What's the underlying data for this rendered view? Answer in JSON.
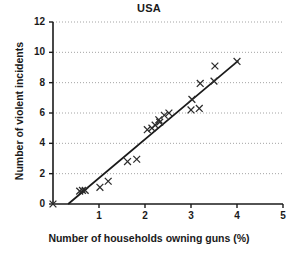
{
  "chart_data": {
    "type": "scatter",
    "title": "USA",
    "xlabel": "Number of households owning guns (%)",
    "ylabel": "Number of violent incidents",
    "xlim": [
      0,
      5
    ],
    "ylim": [
      0,
      12
    ],
    "xticks": [
      "0",
      "1",
      "2",
      "3",
      "4",
      "5"
    ],
    "yticks": [
      "0",
      "2",
      "4",
      "6",
      "8",
      "10",
      "12"
    ],
    "grid": "horizontal-dotted",
    "legend": "none",
    "marker": "x",
    "marker_color": "#2b2b2b",
    "line_color": "#1a1a1a",
    "points": [
      {
        "x": 0.0,
        "y": 0.0
      },
      {
        "x": 0.58,
        "y": 0.85
      },
      {
        "x": 0.64,
        "y": 0.9
      },
      {
        "x": 0.7,
        "y": 0.9
      },
      {
        "x": 1.02,
        "y": 1.1
      },
      {
        "x": 1.2,
        "y": 1.5
      },
      {
        "x": 1.62,
        "y": 2.8
      },
      {
        "x": 1.82,
        "y": 2.95
      },
      {
        "x": 2.05,
        "y": 4.9
      },
      {
        "x": 2.15,
        "y": 5.0
      },
      {
        "x": 2.22,
        "y": 5.2
      },
      {
        "x": 2.3,
        "y": 5.55
      },
      {
        "x": 2.32,
        "y": 5.4
      },
      {
        "x": 2.42,
        "y": 5.85
      },
      {
        "x": 2.52,
        "y": 6.0
      },
      {
        "x": 3.0,
        "y": 6.2
      },
      {
        "x": 3.18,
        "y": 6.3
      },
      {
        "x": 3.02,
        "y": 6.9
      },
      {
        "x": 3.2,
        "y": 7.95
      },
      {
        "x": 3.5,
        "y": 8.1
      },
      {
        "x": 3.52,
        "y": 9.1
      },
      {
        "x": 4.0,
        "y": 9.4
      }
    ],
    "trendline": {
      "x_start": 0.33,
      "y_start": 0.0,
      "x_end": 4.03,
      "y_end": 9.45
    }
  },
  "geometry": {
    "plot_left": 53,
    "plot_right": 283,
    "plot_top": 22,
    "plot_bottom": 204
  }
}
